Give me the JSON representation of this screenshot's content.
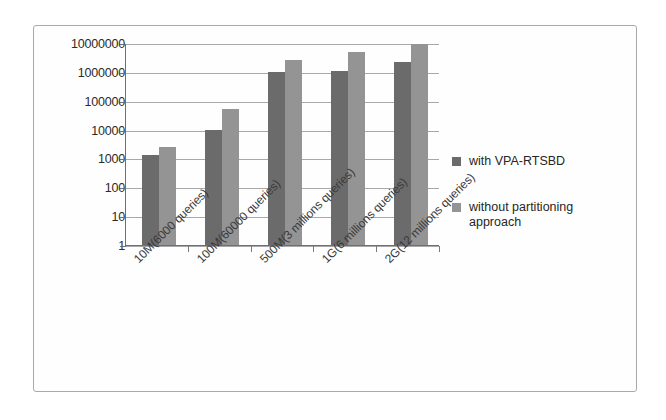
{
  "chart_data": {
    "type": "bar",
    "title": "",
    "xlabel": "",
    "ylabel": "",
    "scale": "log",
    "ylim": [
      1,
      10000000
    ],
    "grid": true,
    "legend_position": "right",
    "yticks": [
      "10000000",
      "1000000",
      "100000",
      "10000",
      "1000",
      "100",
      "10",
      "1"
    ],
    "ytick_values": [
      10000000,
      1000000,
      100000,
      10000,
      1000,
      100,
      10,
      1
    ],
    "categories": [
      "10M(6000 queries)",
      "100M(60000 queries)",
      "500M(3 millions queries)",
      "1G(6 millions queries)",
      "2G(12 millions queries)"
    ],
    "series": [
      {
        "name": "with VPA-RTSBD",
        "color": "#6b6b6b",
        "values": [
          1300,
          10000,
          1000000,
          1100000,
          2200000
        ]
      },
      {
        "name": "without partitioning approach",
        "color": "#949494",
        "values": [
          2400,
          52000,
          2500000,
          4800000,
          9000000
        ]
      }
    ]
  },
  "legend": {
    "items": [
      {
        "label": "with VPA-RTSBD",
        "icon": "square-swatch"
      },
      {
        "label": "without  partitioning approach",
        "icon": "square-swatch"
      }
    ]
  }
}
